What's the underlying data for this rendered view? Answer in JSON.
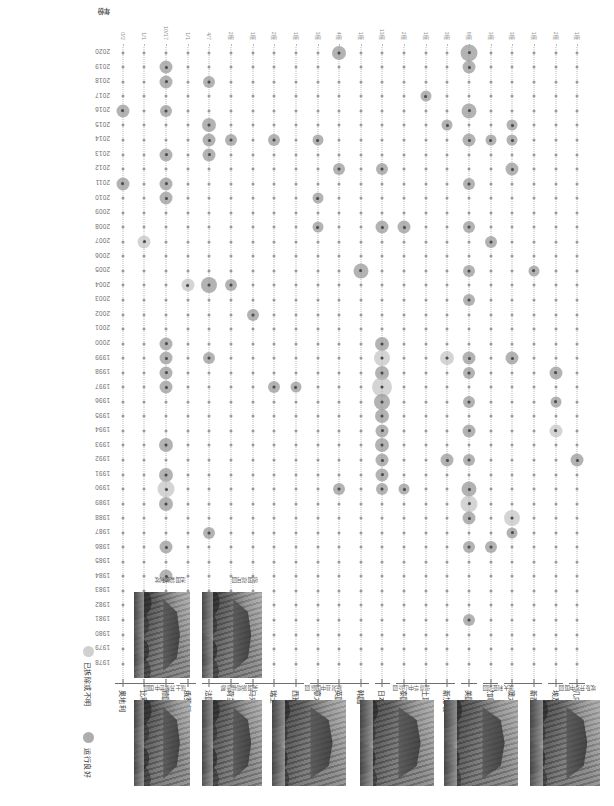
{
  "chart_data": {
    "type": "scatter",
    "title": "",
    "xlabel": "年份",
    "ylabel": "",
    "grid": "dotted",
    "legend_position": "bottom-right",
    "x": [
      "2020",
      "2019",
      "2018",
      "2017",
      "2016",
      "2015",
      "2014",
      "2013",
      "2012",
      "2011",
      "2010",
      "2009",
      "2008",
      "2007",
      "2006",
      "2005",
      "2004",
      "2003",
      "2002",
      "2001",
      "2000",
      "1999",
      "1998",
      "1997",
      "1996",
      "1995",
      "1994",
      "1993",
      "1992",
      "1991",
      "1990",
      "1989",
      "1988",
      "1987",
      "1986",
      "1985",
      "1984",
      "1983",
      "1982",
      "1981",
      "1980",
      "1979",
      "1978"
    ],
    "categories": [
      "几内亚",
      "埃及",
      "新西兰",
      "澳大利亚",
      "加拿大",
      "美国",
      "新加坡",
      "土耳其",
      "泰国",
      "日本",
      "韩国",
      "英国",
      "意大利",
      "西班牙",
      "瑞士",
      "马来西亚",
      "荷兰",
      "法国",
      "俄罗斯",
      "德国",
      "比利时",
      "奥地利"
    ],
    "series": [
      {
        "name": "运行良好",
        "color": "#969696"
      },
      {
        "name": "已拆除或不明",
        "color": "#bababa"
      }
    ],
    "rows": [
      {
        "country": "几内亚",
        "count": "1座",
        "points": [
          {
            "year": "1992",
            "size": 13,
            "status": "ok"
          }
        ]
      },
      {
        "country": "埃及",
        "count": "2座",
        "points": [
          {
            "year": "1998",
            "size": 13,
            "status": "ok"
          },
          {
            "year": "1996",
            "size": 11,
            "status": "ok"
          },
          {
            "year": "1994",
            "size": 13,
            "status": "gone"
          }
        ]
      },
      {
        "country": "新西兰",
        "count": "1座",
        "points": [
          {
            "year": "2005",
            "size": 11,
            "status": "ok"
          }
        ]
      },
      {
        "country": "澳大利亚",
        "count": "3座",
        "points": [
          {
            "year": "2015",
            "size": 11,
            "status": "ok"
          },
          {
            "year": "2014",
            "size": 11,
            "status": "ok"
          },
          {
            "year": "2012",
            "size": 13,
            "status": "ok"
          },
          {
            "year": "1999",
            "size": 13,
            "status": "ok"
          },
          {
            "year": "1988",
            "size": 16,
            "status": "gone"
          },
          {
            "year": "1987",
            "size": 11,
            "status": "ok"
          }
        ]
      },
      {
        "country": "加拿大",
        "count": "3座",
        "points": [
          {
            "year": "2014",
            "size": 11,
            "status": "ok"
          },
          {
            "year": "2007",
            "size": 12,
            "status": "ok"
          },
          {
            "year": "1986",
            "size": 12,
            "status": "ok"
          }
        ]
      },
      {
        "country": "美国",
        "count": "9座",
        "points": [
          {
            "year": "2020",
            "size": 17,
            "status": "ok"
          },
          {
            "year": "2019",
            "size": 13,
            "status": "ok"
          },
          {
            "year": "2016",
            "size": 15,
            "status": "ok"
          },
          {
            "year": "2014",
            "size": 13,
            "status": "ok"
          },
          {
            "year": "2011",
            "size": 12,
            "status": "ok"
          },
          {
            "year": "2008",
            "size": 12,
            "status": "ok"
          },
          {
            "year": "2005",
            "size": 12,
            "status": "ok"
          },
          {
            "year": "2003",
            "size": 12,
            "status": "ok"
          },
          {
            "year": "1999",
            "size": 13,
            "status": "ok"
          },
          {
            "year": "1998",
            "size": 12,
            "status": "ok"
          },
          {
            "year": "1996",
            "size": 12,
            "status": "ok"
          },
          {
            "year": "1994",
            "size": 13,
            "status": "ok"
          },
          {
            "year": "1992",
            "size": 12,
            "status": "ok"
          },
          {
            "year": "1990",
            "size": 15,
            "status": "ok"
          },
          {
            "year": "1989",
            "size": 17,
            "status": "gone"
          },
          {
            "year": "1988",
            "size": 13,
            "status": "ok"
          },
          {
            "year": "1986",
            "size": 12,
            "status": "ok"
          },
          {
            "year": "1981",
            "size": 12,
            "status": "ok"
          }
        ]
      },
      {
        "country": "新加坡",
        "count": "3座",
        "points": [
          {
            "year": "2015",
            "size": 11,
            "status": "ok"
          },
          {
            "year": "1999",
            "size": 14,
            "status": "gone"
          },
          {
            "year": "1992",
            "size": 13,
            "status": "ok"
          }
        ]
      },
      {
        "country": "土耳其",
        "count": "1座",
        "points": [
          {
            "year": "2017",
            "size": 11,
            "status": "ok"
          }
        ]
      },
      {
        "country": "泰国",
        "count": "2座",
        "points": [
          {
            "year": "2008",
            "size": 13,
            "status": "ok"
          },
          {
            "year": "1990",
            "size": 11,
            "status": "ok"
          }
        ]
      },
      {
        "country": "日本",
        "count": "13座",
        "points": [
          {
            "year": "2012",
            "size": 12,
            "status": "ok"
          },
          {
            "year": "2008",
            "size": 13,
            "status": "ok"
          },
          {
            "year": "2000",
            "size": 14,
            "status": "ok"
          },
          {
            "year": "1999",
            "size": 16,
            "status": "gone"
          },
          {
            "year": "1998",
            "size": 14,
            "status": "ok"
          },
          {
            "year": "1997",
            "size": 20,
            "status": "gone"
          },
          {
            "year": "1996",
            "size": 16,
            "status": "ok"
          },
          {
            "year": "1995",
            "size": 14,
            "status": "ok"
          },
          {
            "year": "1994",
            "size": 13,
            "status": "ok"
          },
          {
            "year": "1993",
            "size": 14,
            "status": "ok"
          },
          {
            "year": "1992",
            "size": 13,
            "status": "ok"
          },
          {
            "year": "1991",
            "size": 13,
            "status": "ok"
          },
          {
            "year": "1990",
            "size": 12,
            "status": "ok"
          }
        ]
      },
      {
        "country": "韩国",
        "count": "1座",
        "points": [
          {
            "year": "2005",
            "size": 15,
            "status": "ok"
          }
        ]
      },
      {
        "country": "英国",
        "count": "4座",
        "points": [
          {
            "year": "2020",
            "size": 14,
            "status": "ok"
          },
          {
            "year": "2012",
            "size": 12,
            "status": "ok"
          },
          {
            "year": "1990",
            "size": 12,
            "status": "ok"
          }
        ]
      },
      {
        "country": "意大利",
        "count": "3座",
        "points": [
          {
            "year": "2014",
            "size": 11,
            "status": "ok"
          },
          {
            "year": "2010",
            "size": 11,
            "status": "ok"
          },
          {
            "year": "2008",
            "size": 11,
            "status": "ok"
          }
        ]
      },
      {
        "country": "西班牙",
        "count": "1座",
        "points": [
          {
            "year": "1997",
            "size": 11,
            "status": "ok"
          }
        ]
      },
      {
        "country": "瑞士",
        "count": "2座",
        "points": [
          {
            "year": "2014",
            "size": 12,
            "status": "ok"
          },
          {
            "year": "1997",
            "size": 12,
            "status": "ok"
          }
        ]
      },
      {
        "country": "马来西亚",
        "count": "1座",
        "points": [
          {
            "year": "2002",
            "size": 12,
            "status": "ok"
          }
        ]
      },
      {
        "country": "荷兰",
        "count": "2座",
        "points": [
          {
            "year": "2014",
            "size": 12,
            "status": "ok"
          },
          {
            "year": "2004",
            "size": 12,
            "status": "ok"
          }
        ]
      },
      {
        "country": "法国",
        "count": "4/7",
        "points": [
          {
            "year": "2018",
            "size": 12,
            "status": "ok"
          },
          {
            "year": "2015",
            "size": 14,
            "status": "ok"
          },
          {
            "year": "2014",
            "size": 13,
            "status": "ok"
          },
          {
            "year": "2013",
            "size": 13,
            "status": "ok"
          },
          {
            "year": "2004",
            "size": 16,
            "status": "ok"
          },
          {
            "year": "1999",
            "size": 12,
            "status": "ok"
          },
          {
            "year": "1987",
            "size": 12,
            "status": "ok"
          }
        ]
      },
      {
        "country": "俄罗斯",
        "count": "1/1",
        "points": [
          {
            "year": "2004",
            "size": 13,
            "status": "gone"
          }
        ]
      },
      {
        "country": "德国",
        "count": "10/17",
        "points": [
          {
            "year": "2019",
            "size": 13,
            "status": "ok"
          },
          {
            "year": "2018",
            "size": 13,
            "status": "ok"
          },
          {
            "year": "2016",
            "size": 12,
            "status": "ok"
          },
          {
            "year": "2013",
            "size": 13,
            "status": "ok"
          },
          {
            "year": "2011",
            "size": 13,
            "status": "ok"
          },
          {
            "year": "2010",
            "size": 13,
            "status": "ok"
          },
          {
            "year": "2000",
            "size": 13,
            "status": "ok"
          },
          {
            "year": "1999",
            "size": 13,
            "status": "ok"
          },
          {
            "year": "1998",
            "size": 13,
            "status": "ok"
          },
          {
            "year": "1997",
            "size": 13,
            "status": "ok"
          },
          {
            "year": "1993",
            "size": 14,
            "status": "ok"
          },
          {
            "year": "1991",
            "size": 14,
            "status": "ok"
          },
          {
            "year": "1990",
            "size": 17,
            "status": "gone"
          },
          {
            "year": "1989",
            "size": 14,
            "status": "ok"
          },
          {
            "year": "1986",
            "size": 13,
            "status": "ok"
          },
          {
            "year": "1984",
            "size": 13,
            "status": "ok"
          }
        ]
      },
      {
        "country": "比利时",
        "count": "1/1",
        "points": [
          {
            "year": "2007",
            "size": 13,
            "status": "gone"
          }
        ]
      },
      {
        "country": "奥地利",
        "count": "0/2",
        "points": [
          {
            "year": "2016",
            "size": 13,
            "status": "ok"
          },
          {
            "year": "2011",
            "size": 13,
            "status": "ok"
          }
        ]
      }
    ]
  },
  "axis": {
    "x_title": "年份",
    "x_ticks": [
      "2020",
      "2019",
      "2018",
      "2017",
      "2016",
      "2015",
      "2014",
      "2013",
      "2012",
      "2011",
      "2010",
      "2009",
      "2008",
      "2007",
      "2006",
      "2005",
      "2004",
      "2003",
      "2002",
      "2001",
      "2000",
      "1999",
      "1998",
      "1997",
      "1996",
      "1995",
      "1994",
      "1993",
      "1992",
      "1991",
      "1990",
      "1989",
      "1988",
      "1987",
      "1986",
      "1985",
      "1984",
      "1983",
      "1982",
      "1981",
      "1980",
      "1979",
      "1978"
    ]
  },
  "legend": {
    "items": [
      {
        "label": "已拆除或不明",
        "status": "gone"
      },
      {
        "label": "运行良好",
        "status": "ok"
      }
    ]
  },
  "photos": [
    {
      "caption": "埃及开罗中国园",
      "country": "埃及"
    },
    {
      "caption": "澳大利亚谊园",
      "country": "澳大利亚"
    },
    {
      "caption": "温哥华中山公园",
      "country": "加拿大"
    },
    {
      "caption": "新潟县中国庭园",
      "country": "日本"
    },
    {
      "caption": "英国斯塔福德郡",
      "country": "英国"
    },
    {
      "caption": "瑞士苏黎世中国园",
      "country": "瑞士"
    },
    {
      "caption": "法国蒙彼利埃",
      "country": "法国"
    },
    {
      "caption": "德国得月园",
      "country": "德国"
    }
  ]
}
